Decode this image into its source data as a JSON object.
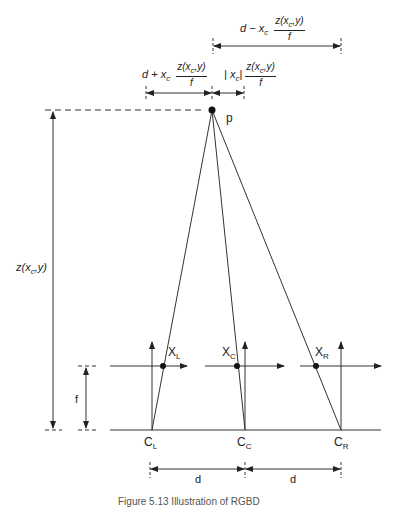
{
  "diagram": {
    "point_label": "p",
    "depth_label": {
      "z": "z(x",
      "sub": "c",
      "rest": ",y)"
    },
    "focal_label": "f",
    "baseline_labels": [
      "d",
      "d"
    ],
    "cameras": [
      {
        "label": "C",
        "sub": "L"
      },
      {
        "label": "C",
        "sub": "C"
      },
      {
        "label": "C",
        "sub": "R"
      }
    ],
    "projections": [
      {
        "label": "X",
        "sub": "L"
      },
      {
        "label": "X",
        "sub": "C"
      },
      {
        "label": "X",
        "sub": "R"
      }
    ],
    "top_formulas": {
      "right_span": {
        "prefix": "d − x",
        "sub": "c",
        "num": "z(x",
        "num_sub": "c",
        "num_rest": ",y)",
        "den": "f"
      },
      "left_span": {
        "prefix": "d + x",
        "sub": "c",
        "num": "z(x",
        "num_sub": "c",
        "num_rest": ",y)",
        "den": "f"
      },
      "center_span": {
        "prefix": "| x",
        "sub": "c",
        "suffix": "|",
        "num": "z(x",
        "num_sub": "c",
        "num_rest": ",y)",
        "den": "f"
      }
    },
    "caption": "Figure 5.13   Illustration of RGBD",
    "colors": {
      "line": "#333333",
      "text": "#222222"
    }
  }
}
